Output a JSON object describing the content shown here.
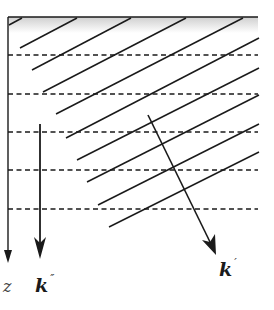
{
  "diagram": {
    "labels": {
      "z_axis": "z",
      "k_double_prime": "k",
      "k_double_prime_mark": "″",
      "k_prime": "k",
      "k_prime_mark": "′"
    },
    "elements": {
      "wavefront_count": 10,
      "dashed_layer_count": 5,
      "shaded_surface_band": true
    },
    "colors": {
      "line": "#1a1a1a",
      "shade": "#d8d8d8",
      "background": "#ffffff"
    }
  }
}
